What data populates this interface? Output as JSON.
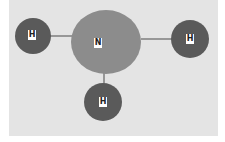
{
  "diagram": {
    "title": "",
    "colors": {
      "background": "#e4e4e4",
      "nitrogen": "#8c8c8c",
      "hydrogen": "#5a5a5a",
      "bond": "#4a4a4a",
      "label_bg": "#ffffff"
    },
    "atoms": [
      {
        "id": "H1",
        "label": "H",
        "element": "hydrogen",
        "cx": 33,
        "cy": 36,
        "r": 18
      },
      {
        "id": "N",
        "label": "N",
        "element": "nitrogen",
        "cx": 106,
        "cy": 42,
        "rx": 35,
        "ry": 32
      },
      {
        "id": "H2",
        "label": "H",
        "element": "hydrogen",
        "cx": 190,
        "cy": 39,
        "r": 19
      },
      {
        "id": "H3",
        "label": "H",
        "element": "hydrogen",
        "cx": 103,
        "cy": 102,
        "r": 19
      }
    ],
    "bonds": [
      {
        "from": "N",
        "to": "H1"
      },
      {
        "from": "N",
        "to": "H2"
      },
      {
        "from": "N",
        "to": "H3"
      }
    ]
  }
}
